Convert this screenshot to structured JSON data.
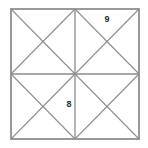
{
  "figure": {
    "type": "geometry-diagram",
    "background_color": "#ffffff",
    "outer_border_color": "#808080",
    "inner_line_color": "#8a8a8a",
    "diagonal_color": "#8f8f8f",
    "label_color": "#2b2b2b",
    "square": {
      "left": 11,
      "top": 9,
      "right": 139,
      "bottom": 139,
      "width": 128,
      "height": 130
    },
    "center_point": {
      "x": 75,
      "y": 74
    },
    "midlines": {
      "vertical_x": 75,
      "horizontal_y": 74
    },
    "quadrants": [
      {
        "name": "top-left",
        "has_diagonals": true,
        "label": ""
      },
      {
        "name": "top-right",
        "has_diagonals": true,
        "label": "9"
      },
      {
        "name": "bottom-left",
        "has_diagonals": true,
        "label": "8"
      },
      {
        "name": "bottom-right",
        "has_diagonals": true,
        "label": ""
      }
    ],
    "labels": [
      {
        "id": "label-9",
        "text": "9",
        "x": 107,
        "y": 20,
        "quadrant": "top-right"
      },
      {
        "id": "label-8",
        "text": "8",
        "x": 69,
        "y": 105,
        "quadrant": "bottom-left"
      }
    ]
  }
}
